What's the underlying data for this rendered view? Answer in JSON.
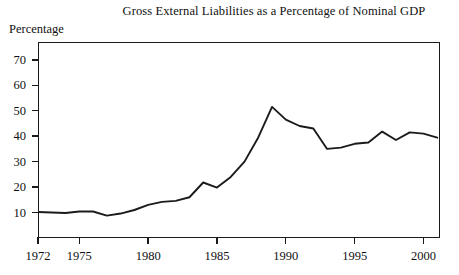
{
  "chart_data": {
    "type": "line",
    "title": "Gross External Liabilities as a Percentage of Nominal GDP",
    "ylabel": "Percentage",
    "xlabel": "",
    "grid": false,
    "legend": "none",
    "xlim": [
      1972,
      2001.2
    ],
    "ylim": [
      0,
      77
    ],
    "yticks": [
      10,
      20,
      30,
      40,
      50,
      60,
      70
    ],
    "ytick_labels": [
      "10",
      "20",
      "30",
      "40",
      "50",
      "60",
      "70"
    ],
    "xticks": [
      1972,
      1975,
      1980,
      1985,
      1990,
      1995,
      2000
    ],
    "xtick_labels": [
      "1972",
      "1975",
      "1980",
      "1985",
      "1990",
      "1995",
      "2000"
    ],
    "line_color": "#1b1b1b",
    "x": [
      1972,
      1973,
      1974,
      1975,
      1976,
      1977,
      1978,
      1979,
      1980,
      1981,
      1982,
      1983,
      1984,
      1985,
      1986,
      1987,
      1988,
      1989,
      1990,
      1991,
      1992,
      1993,
      1994,
      1995,
      1996,
      1997,
      1998,
      1999,
      2000,
      2001
    ],
    "values": [
      10.2,
      10.0,
      9.8,
      10.4,
      10.4,
      8.8,
      9.6,
      11.0,
      13.0,
      14.2,
      14.6,
      16.0,
      21.8,
      19.8,
      24.0,
      30.0,
      39.5,
      51.5,
      46.5,
      44.0,
      43.0,
      35.0,
      35.5,
      37.0,
      37.5,
      41.8,
      38.5,
      41.5,
      41.0,
      39.4
    ],
    "series": [
      {
        "name": "Gross External Liabilities (% of Nominal GDP)",
        "values": [
          10.2,
          10.0,
          9.8,
          10.4,
          10.4,
          8.8,
          9.6,
          11.0,
          13.0,
          14.2,
          14.6,
          16.0,
          21.8,
          19.8,
          24.0,
          30.0,
          39.5,
          51.5,
          46.5,
          44.0,
          43.0,
          35.0,
          35.5,
          37.0,
          37.5,
          41.8,
          38.5,
          41.5,
          41.0,
          39.4
        ]
      }
    ],
    "peak": {
      "year": 1989,
      "value": 51.5
    },
    "trough": {
      "year": 1977,
      "value": 8.8
    }
  }
}
